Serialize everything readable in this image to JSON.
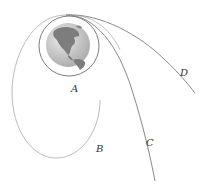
{
  "diagram": {
    "type": "orbital-trajectories",
    "central_body": "earth",
    "labels": {
      "A": "A",
      "B": "B",
      "C": "C",
      "D": "D"
    },
    "trajectories": [
      {
        "id": "A",
        "shape": "circle"
      },
      {
        "id": "B",
        "shape": "ellipse"
      },
      {
        "id": "C",
        "shape": "open-curve"
      },
      {
        "id": "D",
        "shape": "open-curve"
      }
    ],
    "colors": {
      "line": "#8a8a8a",
      "ellipse_line": "#b0b0b0",
      "ocean": "#bdbdbd",
      "land": "#7a7a7a",
      "label": "#333333"
    }
  }
}
